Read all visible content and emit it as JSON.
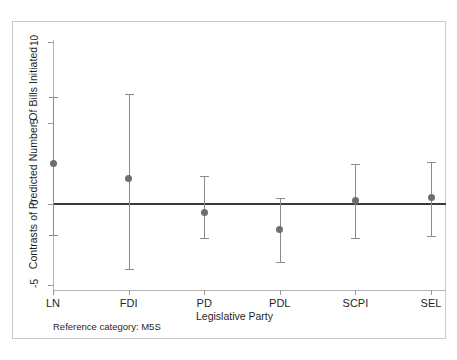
{
  "chart_data": {
    "type": "scatter",
    "title": "",
    "subtitle": "",
    "xlabel": "Legislative Party",
    "ylabel": "Contrasts of Predicted Number Of Bills Initiated",
    "categories": [
      "LN",
      "FDI",
      "PD",
      "PDL",
      "SCPI",
      "SEL"
    ],
    "values": [
      2.5,
      1.6,
      -0.5,
      -1.6,
      0.2,
      0.4
    ],
    "ci_lower": [
      -1.9,
      -4.0,
      -2.1,
      -3.6,
      -2.1,
      -2.0
    ],
    "ci_upper": [
      6.6,
      6.8,
      1.7,
      0.4,
      2.5,
      2.6
    ],
    "series": [
      {
        "name": "Contrast vs M5S",
        "points": [
          {
            "category": "LN",
            "value": 2.5,
            "ci_lower": -1.9,
            "ci_upper": 6.6
          },
          {
            "category": "FDI",
            "value": 1.6,
            "ci_lower": -4.0,
            "ci_upper": 6.8
          },
          {
            "category": "PD",
            "value": -0.5,
            "ci_lower": -2.1,
            "ci_upper": 1.7
          },
          {
            "category": "PDL",
            "value": -1.6,
            "ci_lower": -3.6,
            "ci_upper": 0.4
          },
          {
            "category": "SCPI",
            "value": 0.2,
            "ci_lower": -2.1,
            "ci_upper": 2.5
          },
          {
            "category": "SEL",
            "value": 0.4,
            "ci_lower": -2.0,
            "ci_upper": 2.6
          }
        ]
      }
    ],
    "ylim": [
      -5.6,
      10.5
    ],
    "yticks": [
      10,
      5,
      0,
      -5
    ],
    "ytick_labels": [
      "10",
      "5",
      "0",
      "-5"
    ],
    "grid": false,
    "legend": "none",
    "reference_line": {
      "y": 0,
      "color": "#3a3a3a"
    },
    "annotations": [
      {
        "name": "reference-category-note",
        "text": "Reference category: M5S"
      }
    ],
    "colors": {
      "marker": "#6e6e6e",
      "errorbar": "#8c8c8c",
      "zero_line": "#3a3a3a",
      "axis": "#b4b4b4",
      "frame": "#c9c9c9",
      "background": "#ffffff",
      "text": "#1f1f1f"
    }
  },
  "footnote": {
    "text": "Reference category: M5S"
  }
}
